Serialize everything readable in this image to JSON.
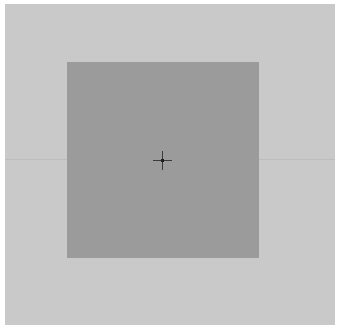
{
  "canvas": {
    "background_color": "#c9c9c9",
    "square_color": "#9b9b9b",
    "crosshair_color": "#3a3a3a"
  },
  "icons": {
    "crosshair": "crosshair-icon"
  }
}
